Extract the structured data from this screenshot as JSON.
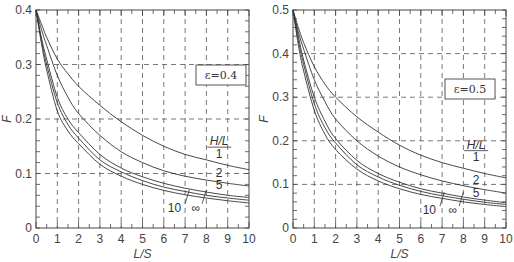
{
  "chart_data": [
    {
      "type": "line",
      "title": "",
      "annotation": "ε=0.4",
      "xlabel": "L/S",
      "ylabel": "F",
      "xlim": [
        0,
        10
      ],
      "ylim": [
        0,
        0.4
      ],
      "xticks": [
        "0",
        "1",
        "2",
        "3",
        "4",
        "5",
        "6",
        "7",
        "8",
        "9",
        "10"
      ],
      "yticks": [
        "0",
        "0.1",
        "0.2",
        "0.3",
        "0.4"
      ],
      "grid": "dashed",
      "legend_title": "H/L",
      "x": [
        0,
        0.25,
        0.5,
        1,
        1.5,
        2,
        3,
        4,
        5,
        6,
        7,
        8,
        9,
        10
      ],
      "series": [
        {
          "name": "1",
          "values": [
            0.4,
            0.375,
            0.35,
            0.31,
            0.283,
            0.26,
            0.225,
            0.195,
            0.17,
            0.15,
            0.135,
            0.125,
            0.115,
            0.107
          ]
        },
        {
          "name": "2",
          "values": [
            0.4,
            0.365,
            0.335,
            0.28,
            0.24,
            0.21,
            0.17,
            0.14,
            0.12,
            0.105,
            0.095,
            0.088,
            0.082,
            0.077
          ]
        },
        {
          "name": "5",
          "values": [
            0.4,
            0.35,
            0.31,
            0.24,
            0.2,
            0.175,
            0.135,
            0.11,
            0.094,
            0.082,
            0.073,
            0.066,
            0.06,
            0.056
          ]
        },
        {
          "name": "10",
          "values": [
            0.4,
            0.345,
            0.3,
            0.23,
            0.19,
            0.165,
            0.125,
            0.103,
            0.087,
            0.075,
            0.067,
            0.06,
            0.055,
            0.051
          ]
        },
        {
          "name": "∞",
          "values": [
            0.4,
            0.34,
            0.29,
            0.215,
            0.178,
            0.155,
            0.117,
            0.095,
            0.08,
            0.069,
            0.061,
            0.055,
            0.05,
            0.046
          ]
        }
      ],
      "curve_labels": [
        {
          "text": "H/L",
          "x": 8.6,
          "y": 0.152,
          "underline": true
        },
        {
          "text": "1",
          "x": 8.6,
          "y": 0.128
        },
        {
          "text": "2",
          "x": 8.6,
          "y": 0.094
        },
        {
          "text": "5",
          "x": 8.6,
          "y": 0.072
        },
        {
          "text": "10",
          "x": 6.5,
          "y": 0.03
        },
        {
          "text": "∞",
          "x": 7.5,
          "y": 0.03
        }
      ]
    },
    {
      "type": "line",
      "title": "",
      "annotation": "ε=0.5",
      "xlabel": "L/S",
      "ylabel": "F",
      "xlim": [
        0,
        10
      ],
      "ylim": [
        0,
        0.5
      ],
      "xticks": [
        "0",
        "1",
        "2",
        "3",
        "4",
        "5",
        "6",
        "7",
        "8",
        "9",
        "10"
      ],
      "yticks": [
        "0",
        "0.1",
        "0.2",
        "0.3",
        "0.4",
        "0.5"
      ],
      "grid": "dashed",
      "legend_title": "H/L",
      "x": [
        0,
        0.25,
        0.5,
        1,
        1.5,
        2,
        3,
        4,
        5,
        6,
        7,
        8,
        9,
        10
      ],
      "series": [
        {
          "name": "1",
          "values": [
            0.5,
            0.46,
            0.425,
            0.37,
            0.33,
            0.3,
            0.255,
            0.22,
            0.19,
            0.167,
            0.15,
            0.137,
            0.125,
            0.115
          ]
        },
        {
          "name": "2",
          "values": [
            0.5,
            0.45,
            0.41,
            0.34,
            0.29,
            0.25,
            0.2,
            0.165,
            0.14,
            0.122,
            0.108,
            0.097,
            0.088,
            0.08
          ]
        },
        {
          "name": "5",
          "values": [
            0.5,
            0.44,
            0.385,
            0.3,
            0.245,
            0.205,
            0.155,
            0.125,
            0.105,
            0.09,
            0.08,
            0.071,
            0.064,
            0.058
          ]
        },
        {
          "name": "10",
          "values": [
            0.5,
            0.43,
            0.375,
            0.285,
            0.23,
            0.195,
            0.145,
            0.117,
            0.098,
            0.084,
            0.074,
            0.066,
            0.059,
            0.054
          ]
        },
        {
          "name": "∞",
          "values": [
            0.5,
            0.42,
            0.36,
            0.27,
            0.215,
            0.18,
            0.135,
            0.108,
            0.09,
            0.077,
            0.068,
            0.06,
            0.054,
            0.049
          ]
        }
      ],
      "curve_labels": [
        {
          "text": "H/L",
          "x": 8.6,
          "y": 0.182,
          "underline": true
        },
        {
          "text": "1",
          "x": 8.6,
          "y": 0.153
        },
        {
          "text": "2",
          "x": 8.6,
          "y": 0.1
        },
        {
          "text": "5",
          "x": 8.6,
          "y": 0.072
        },
        {
          "text": "10",
          "x": 6.4,
          "y": 0.032
        },
        {
          "text": "∞",
          "x": 7.5,
          "y": 0.032
        }
      ]
    }
  ]
}
